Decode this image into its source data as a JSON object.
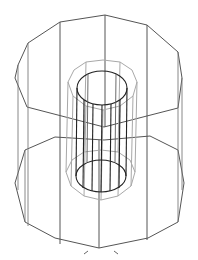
{
  "figure": {
    "title": "",
    "description": "Wireframe 3D render of nested prisms: outer dodecagonal shell, middle gray tube, inner dark cylinder",
    "colors": {
      "background": "#ffffff",
      "outer_edges": "#555555",
      "middle_tube": "#a8a8a8",
      "inner_cylinder": "#222222"
    },
    "parts": [
      {
        "name": "outer-shell",
        "shape": "12-sided prism"
      },
      {
        "name": "middle-tube",
        "shape": "polygonal tube"
      },
      {
        "name": "inner-cylinder",
        "shape": "cylinder"
      }
    ]
  }
}
